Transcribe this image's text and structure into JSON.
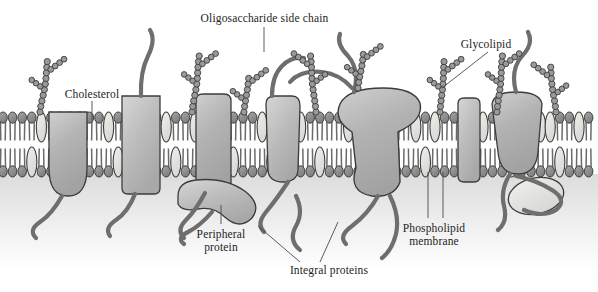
{
  "figure": {
    "width": 598,
    "height": 292,
    "background_color": "#ffffff",
    "palette": {
      "outline": "#3c3c3c",
      "lipid_head_dark": "#8c8c8c",
      "lipid_head_light": "#dedede",
      "cholesterol_fill": "#e2e2e0",
      "protein_fill": "#b4b4b4",
      "protein_fill_light": "#c9c9c9",
      "filament": "#6e6e6e",
      "sugar_bead": "#9a9a9a",
      "cytoplasm_shade": "#e9e9e9",
      "label_text": "#1d1d1d",
      "leader_line": "#4a4a4a"
    }
  },
  "labels": [
    {
      "id": "oligosaccharide-side-chain",
      "text": "Oligosaccharide side chain",
      "lines": [
        "Oligosaccharide side chain"
      ],
      "x": 197,
      "y": 12,
      "width": 135,
      "align": "center"
    },
    {
      "id": "cholesterol",
      "text": "Cholesterol",
      "lines": [
        "Cholesterol"
      ],
      "x": 56,
      "y": 88,
      "width": 72,
      "align": "center"
    },
    {
      "id": "glycolipid",
      "text": "Glycolipid",
      "lines": [
        "Glycolipid"
      ],
      "x": 455,
      "y": 38,
      "width": 62,
      "align": "center"
    },
    {
      "id": "peripheral-protein",
      "text": "Peripheral protein",
      "lines": [
        "Peripheral",
        "protein"
      ],
      "x": 186,
      "y": 228,
      "width": 70,
      "align": "center"
    },
    {
      "id": "phospholipid-membrane",
      "text": "Phospholipid membrane",
      "lines": [
        "Phospholipid",
        "membrane"
      ],
      "x": 390,
      "y": 222,
      "width": 88,
      "align": "center"
    },
    {
      "id": "integral-proteins",
      "text": "Integral proteins",
      "lines": [
        "Integral proteins"
      ],
      "x": 280,
      "y": 264,
      "width": 98,
      "align": "center"
    }
  ],
  "structures": {
    "membrane": {
      "name": "phospholipid bilayer",
      "top_y": 110,
      "bottom_y": 176,
      "outer_leaflet_y": 112,
      "inner_leaflet_y": 145,
      "leaflet_height": 32,
      "lipid_spacing": 9.6,
      "lipid_count_per_leaflet": 62
    },
    "integral_proteins": [
      {
        "id": "integral-protein-1",
        "cx": 66,
        "type": "small-knob",
        "label_target": true
      },
      {
        "id": "integral-protein-2",
        "cx": 141,
        "type": "channel-block",
        "label_target": false
      },
      {
        "id": "integral-protein-3",
        "cx": 212,
        "type": "column",
        "label_target": true
      },
      {
        "id": "integral-protein-4",
        "cx": 282,
        "type": "tapered",
        "label_target": false
      },
      {
        "id": "integral-protein-5",
        "cx": 383,
        "type": "mushroom-large",
        "label_target": false
      },
      {
        "id": "integral-protein-6",
        "cx": 466,
        "type": "narrow-bar",
        "label_target": false
      },
      {
        "id": "integral-protein-7",
        "cx": 516,
        "type": "funnel",
        "label_target": false
      }
    ],
    "peripheral_proteins": [
      {
        "id": "peripheral-protein-1",
        "cx": 216,
        "cy": 207,
        "type": "crescent"
      },
      {
        "id": "peripheral-protein-2",
        "cx": 534,
        "cy": 196,
        "type": "oval-blob"
      }
    ],
    "cholesterol_positions_outer": [
      38,
      105,
      162,
      200,
      258,
      300,
      348,
      412,
      432,
      480,
      545,
      575
    ],
    "cholesterol_positions_inner": [
      28,
      80,
      120,
      175,
      230,
      268,
      320,
      368,
      424,
      470,
      508,
      560
    ],
    "oligosaccharide_chains": [
      {
        "id": "sugar-chain-1",
        "anchor_x": 40,
        "anchor_y": 112,
        "height": 58
      },
      {
        "id": "sugar-chain-2",
        "anchor_x": 192,
        "anchor_y": 112,
        "height": 62
      },
      {
        "id": "sugar-chain-3",
        "anchor_x": 244,
        "anchor_y": 112,
        "height": 38
      },
      {
        "id": "sugar-chain-4",
        "anchor_x": 316,
        "anchor_y": 112,
        "height": 64
      },
      {
        "id": "sugar-chain-5",
        "anchor_x": 358,
        "anchor_y": 88,
        "height": 40
      },
      {
        "id": "sugar-chain-6",
        "anchor_x": 440,
        "anchor_y": 112,
        "height": 56
      },
      {
        "id": "sugar-chain-7",
        "anchor_x": 497,
        "anchor_y": 112,
        "height": 62
      },
      {
        "id": "sugar-chain-8",
        "anchor_x": 556,
        "anchor_y": 112,
        "height": 52
      }
    ],
    "glycolipid": {
      "id": "glycolipid-structure",
      "anchor_x": 440,
      "anchor_y": 112
    }
  },
  "leader_lines": [
    {
      "id": "leader-oligosaccharide",
      "points": "264,27 264,52"
    },
    {
      "id": "leader-cholesterol",
      "points": "92,101 92,120"
    },
    {
      "id": "leader-glycolipid",
      "points": "488,52 442,88"
    },
    {
      "id": "leader-peripheral",
      "points": "221,224 221,205"
    },
    {
      "id": "leader-phospholipid-1",
      "points": "428,218 428,172"
    },
    {
      "id": "leader-phospholipid-2",
      "points": "443,218 443,172"
    },
    {
      "id": "leader-integral-1",
      "points": "300,262 258,226"
    },
    {
      "id": "leader-integral-2",
      "points": "320,262 338,222"
    }
  ]
}
